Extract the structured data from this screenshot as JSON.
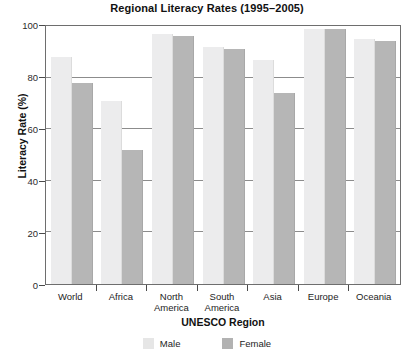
{
  "chart_data": {
    "type": "bar",
    "title": "Regional Literacy Rates (1995–2005)",
    "xlabel": "UNESCO Region",
    "ylabel": "Literacy Rate (%)",
    "categories": [
      "World",
      "Africa",
      "North America",
      "South America",
      "Asia",
      "Europe",
      "Oceania"
    ],
    "series": [
      {
        "name": "Male",
        "color": "#ececed",
        "values": [
          88,
          71,
          97,
          92,
          87,
          99,
          95
        ]
      },
      {
        "name": "Female",
        "color": "#b6b6b6",
        "values": [
          78,
          52,
          96,
          91,
          74,
          99,
          94
        ]
      }
    ],
    "ylim": [
      0,
      100
    ],
    "yticks": [
      0,
      20,
      40,
      60,
      80,
      100
    ],
    "ytick_labels": [
      "0",
      "20",
      "40",
      "60",
      "80",
      "100"
    ],
    "grid": true,
    "legend_position": "bottom-center"
  },
  "axis": {
    "ytick_0": "0",
    "ytick_1": "20",
    "ytick_2": "40",
    "ytick_3": "60",
    "ytick_4": "80",
    "ytick_5": "100",
    "category_0_line1": "World",
    "category_0_line2": "",
    "category_1_line1": "Africa",
    "category_1_line2": "",
    "category_2_line1": "North",
    "category_2_line2": "America",
    "category_3_line1": "South",
    "category_3_line2": "America",
    "category_4_line1": "Asia",
    "category_4_line2": "",
    "category_5_line1": "Europe",
    "category_5_line2": "",
    "category_6_line1": "Oceania",
    "category_6_line2": ""
  },
  "legend": {
    "male_label": "Male",
    "female_label": "Female"
  }
}
